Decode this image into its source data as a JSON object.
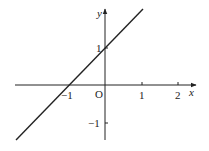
{
  "diagram": {
    "type": "coordinate-plane-line",
    "function": "y = x + 1",
    "axes": {
      "x_label": "x",
      "y_label": "y",
      "origin_label": "O"
    },
    "x_ticks": [
      {
        "value": -1,
        "label": "−1"
      },
      {
        "value": 1,
        "label": "1"
      },
      {
        "value": 2,
        "label": "2"
      }
    ],
    "y_ticks": [
      {
        "value": 1,
        "label": "1"
      },
      {
        "value": -1,
        "label": "−1"
      }
    ],
    "colors": {
      "stroke": "#222222",
      "background": "#ffffff"
    }
  }
}
